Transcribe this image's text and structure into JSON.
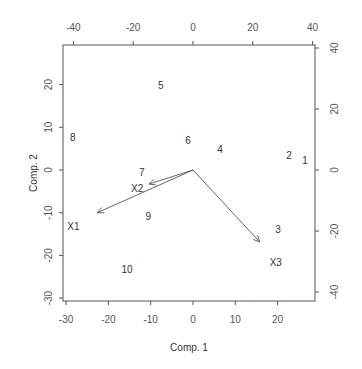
{
  "chart_data": {
    "type": "scatter",
    "subtype": "biplot",
    "title": "",
    "xlabel": "Comp. 1",
    "ylabel": "Comp. 2",
    "xlim": [
      -31,
      28.5
    ],
    "ylim": [
      -30.5,
      29
    ],
    "x_ticks": [
      -30,
      -20,
      -10,
      0,
      10,
      20
    ],
    "y_ticks": [
      -30,
      -20,
      -10,
      0,
      10,
      20
    ],
    "top_ticks": [
      -40,
      -20,
      0,
      20,
      40
    ],
    "right_ticks": [
      -40,
      -20,
      0,
      20,
      40
    ],
    "grid": false,
    "legend": null,
    "points": [
      {
        "label": "1",
        "x": 26.5,
        "y": 2.3
      },
      {
        "label": "2",
        "x": 22.7,
        "y": 3.3
      },
      {
        "label": "3",
        "x": 20.1,
        "y": -14.0
      },
      {
        "label": "4",
        "x": 6.4,
        "y": 4.7
      },
      {
        "label": "5",
        "x": -7.6,
        "y": 19.9
      },
      {
        "label": "6",
        "x": -1.2,
        "y": 7.0
      },
      {
        "label": "7",
        "x": -12.1,
        "y": -0.5
      },
      {
        "label": "8",
        "x": -28.4,
        "y": 7.7
      },
      {
        "label": "9",
        "x": -10.6,
        "y": -10.8
      },
      {
        "label": "10",
        "x": -15.6,
        "y": -23.4
      }
    ],
    "loadings": [
      {
        "label": "X1",
        "x": -32.0,
        "y": -14.0,
        "label_x": -40.0,
        "label_y": -18.4
      },
      {
        "label": "X2",
        "x": -14.7,
        "y": -4.6,
        "label_x": -18.7,
        "label_y": -6.2
      },
      {
        "label": "X3",
        "x": 22.3,
        "y": -23.6,
        "label_x": 27.7,
        "label_y": -30.2
      }
    ]
  },
  "layout": {
    "frame": {
      "left": 63,
      "top": 45,
      "right": 315,
      "bottom": 301
    },
    "bottom_scale": {
      "origin_px": 193,
      "px_per_unit": 4.23
    },
    "left_scale": {
      "origin_px": 170,
      "px_per_unit": 4.27
    },
    "top_scale": {
      "origin_px": 193,
      "px_per_unit": 2.99
    },
    "right_scale": {
      "origin_px": 170,
      "px_per_unit": 3.05
    }
  },
  "colors": {
    "axis": "#555555",
    "text": "#333333",
    "background": "#ffffff"
  }
}
